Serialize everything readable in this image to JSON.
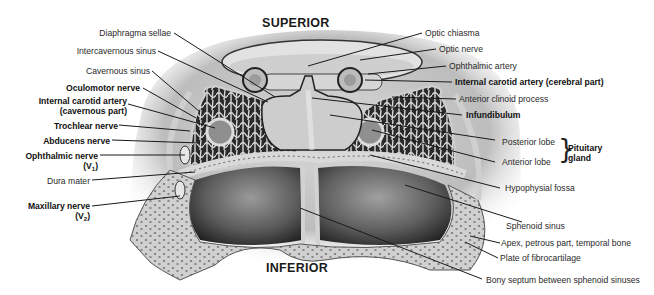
{
  "figure": {
    "orientation": {
      "top": "SUPERIOR",
      "bottom": "INFERIOR"
    },
    "labels_left": [
      {
        "text": "Diaphragma sellae",
        "bold": false
      },
      {
        "text": "Intercavernous sinus",
        "bold": false
      },
      {
        "text": "Cavernous sinus",
        "bold": false
      },
      {
        "text": "Oculomotor nerve",
        "bold": true
      },
      {
        "text": "Internal carotid artery",
        "text2": "(cavernous part)",
        "bold": true
      },
      {
        "text": "Trochlear nerve",
        "bold": true
      },
      {
        "text": "Abducens nerve",
        "bold": true
      },
      {
        "text": "Ophthalmic nerve",
        "text2": "(V",
        "sub": "1",
        "bold": true
      },
      {
        "text": "Dura mater",
        "bold": false
      },
      {
        "text": "Maxillary nerve",
        "text2": "(V",
        "sub": "2",
        "bold": true
      }
    ],
    "labels_right": [
      {
        "text": "Optic chiasma",
        "bold": false
      },
      {
        "text": "Optic nerve",
        "bold": false
      },
      {
        "text": "Ophthalmic artery",
        "bold": false
      },
      {
        "text": "Internal carotid artery (cerebral part)",
        "bold": true
      },
      {
        "text": "Anterior clinoid process",
        "bold": false
      },
      {
        "text": "Infundibulum",
        "bold": true
      },
      {
        "text": "Posterior lobe",
        "bold": false
      },
      {
        "text": "Anterior lobe",
        "bold": false
      },
      {
        "text": "Pituitary",
        "text2": "gland",
        "bold": true
      },
      {
        "text": "Hypophysial fossa",
        "bold": false
      },
      {
        "text": "Sphenoid sinus",
        "bold": false
      },
      {
        "text": "Apex, petrous part, temporal bone",
        "bold": false
      },
      {
        "text": "Plate of fibrocartilage",
        "bold": false
      },
      {
        "text": "Bony septum between sphenoid sinuses",
        "bold": false
      }
    ]
  }
}
